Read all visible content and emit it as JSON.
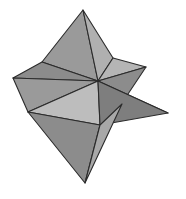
{
  "figure": {
    "name": "stellated-polyhedron",
    "title": "Stellated polyhedron line drawing",
    "background_color": "#ffffff",
    "stroke_color": "#2b2b2b",
    "stroke_width": 1.1,
    "viewbox": "0 0 186 199",
    "palette": {
      "light": "#bdbdbd",
      "light_mid": "#b0b0b0",
      "mid": "#9a9a9a",
      "mid_dark": "#8c8c8c",
      "dark": "#7e7e7e",
      "darker": "#747474"
    },
    "vertices": {
      "top_tip": "83,10",
      "left_tip": "13,78",
      "right_tip": "168,113",
      "bottom_tip": "85,183",
      "upper_right_tip": "146,67",
      "hub": "98,81",
      "upper_left_node": "42,62",
      "left_node": "28,112",
      "bottom_node": "100,125",
      "top_right_node": "113,58",
      "lower_right_node": "124,100"
    },
    "faces": [
      {
        "name": "top-spike-left-face",
        "fill": "#9a9a9a",
        "points": "83,10 42,62 98,81"
      },
      {
        "name": "top-spike-right-face",
        "fill": "#b0b0b0",
        "points": "83,10 98,81 113,58"
      },
      {
        "name": "upper-right-spike-upper-face",
        "fill": "#b5b5b5",
        "points": "113,58 146,67 98,81"
      },
      {
        "name": "upper-right-spike-lower-face",
        "fill": "#8c8c8c",
        "points": "146,67 124,100 98,81"
      },
      {
        "name": "left-spike-upper-face",
        "fill": "#8c8c8c",
        "points": "13,78 42,62 98,81"
      },
      {
        "name": "left-spike-lower-face",
        "fill": "#9a9a9a",
        "points": "13,78 98,81 28,112"
      },
      {
        "name": "lower-left-face",
        "fill": "#bdbdbd",
        "points": "28,112 98,81 100,125"
      },
      {
        "name": "right-spike-upper-face",
        "fill": "#8a8a8a",
        "points": "98,81 124,100 168,113"
      },
      {
        "name": "right-spike-lower-face",
        "fill": "#7e7e7e",
        "points": "98,81 168,113 100,125"
      },
      {
        "name": "bottom-spike-left-face",
        "fill": "#8c8c8c",
        "points": "28,112 100,125 85,183"
      },
      {
        "name": "bottom-spike-right-face",
        "fill": "#a8a8a8",
        "points": "100,125 122,104 85,183"
      }
    ]
  }
}
